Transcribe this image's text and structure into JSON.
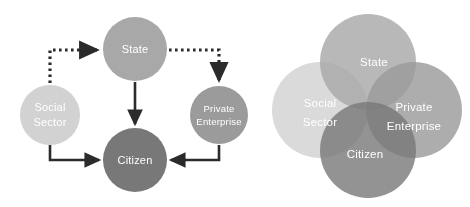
{
  "figure": {
    "background": "#ffffff",
    "label_color": "#ffffff"
  },
  "left_diagram": {
    "name": "actor-relationship-flow-diagram",
    "nodes": {
      "state": {
        "label": "State",
        "color": "#a8a8a8",
        "cx": 135,
        "cy": 49,
        "r": 32
      },
      "social_sector": {
        "label_line1": "Social",
        "label_line2": "Sector",
        "color": "#d2d2d2",
        "cx": 50,
        "cy": 115,
        "r": 30
      },
      "private_enterprise": {
        "label_line1": "Private",
        "label_line2": "Enterprise",
        "color": "#9b9b9b",
        "cx": 219,
        "cy": 115,
        "r": 29
      },
      "citizen": {
        "label": "Citizen",
        "color": "#787878",
        "cx": 135,
        "cy": 160,
        "r": 32
      }
    },
    "arrows": {
      "color": "#2b2b2b",
      "solid": [
        {
          "from": "social_sector",
          "to": "citizen"
        },
        {
          "from": "state",
          "to": "citizen"
        },
        {
          "from": "private_enterprise",
          "to": "citizen"
        }
      ],
      "dotted": [
        {
          "from": "social_sector",
          "to": "state"
        },
        {
          "from": "state",
          "to": "private_enterprise"
        }
      ]
    }
  },
  "right_diagram": {
    "name": "actor-overlap-venn-diagram",
    "circles": {
      "state": {
        "label": "State",
        "color": "#a8a8a8",
        "cx": 106,
        "cy": 62,
        "r": 48
      },
      "social_sector": {
        "label_line1": "Social",
        "label_line2": "Sector",
        "color": "#d2d2d2",
        "cx": 58,
        "cy": 110,
        "r": 48
      },
      "private_enterprise": {
        "label_line1": "Private",
        "label_line2": "Enterprise",
        "color": "#9b9b9b",
        "cx": 152,
        "cy": 110,
        "r": 48
      },
      "citizen": {
        "label": "Citizen",
        "color": "#787878",
        "cx": 106,
        "cy": 150,
        "r": 48
      }
    },
    "opacity": "0.72"
  }
}
